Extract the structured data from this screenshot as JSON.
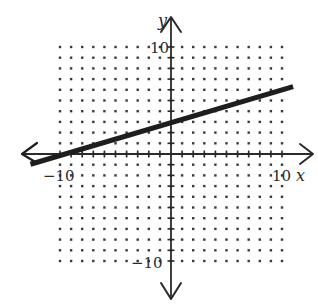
{
  "chart_data": {
    "type": "line",
    "title": "",
    "xlabel": "x",
    "ylabel": "y",
    "xlim": [
      -10,
      10
    ],
    "ylim": [
      -10,
      10
    ],
    "grid": "dotted",
    "grid_step": 1,
    "tick_labels": {
      "x": [
        "-10",
        "10"
      ],
      "y": [
        "10",
        "-10"
      ]
    },
    "series": [
      {
        "name": "line",
        "equation": "y = 0.3x + 3",
        "slope": 0.3,
        "y_intercept": 3,
        "points": [
          [
            -10,
            0
          ],
          [
            0,
            3
          ],
          [
            10,
            6
          ]
        ],
        "arrow_left": true,
        "arrow_right": false
      }
    ],
    "legend": null
  },
  "labels": {
    "x_axis": "x",
    "y_axis": "y",
    "x_min": "−10",
    "x_max": "10",
    "y_max": "10",
    "y_min": "−10"
  },
  "colors": {
    "axis": "#2a2a2a",
    "line": "#1e1e1e",
    "dots": "#3a3a3a"
  }
}
